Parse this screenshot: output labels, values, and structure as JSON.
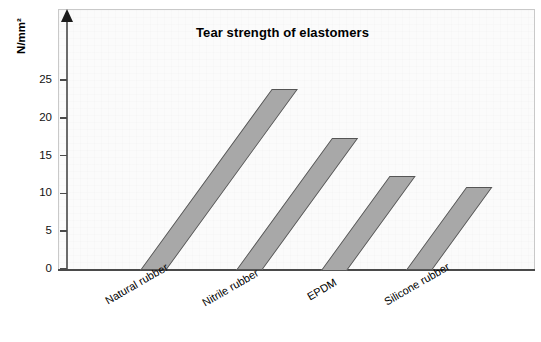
{
  "chart_data": {
    "type": "bar",
    "title": "Tear strength of elastomers",
    "xlabel": "",
    "ylabel": "N/mm²",
    "categories": [
      "Natural rubber",
      "Nitrile rubber",
      "EPDM",
      "Silicone rubber"
    ],
    "values": [
      24,
      17.5,
      12.5,
      11
    ],
    "values_back": [
      26.5,
      20,
      15,
      13.5
    ],
    "ytick_labels": [
      "0",
      "5",
      "10",
      "15",
      "20",
      "25"
    ],
    "ytick_values": [
      0,
      5,
      10,
      15,
      20,
      25
    ],
    "ylim": [
      0,
      29
    ],
    "grid": false,
    "legend": "none",
    "style": "pseudo-3d skewed bars",
    "bar_color": "#a8a8a8",
    "bar_edge_color": "#555555",
    "plot_bg": "#fbfbfb",
    "axis_color": "#4a4a4a"
  },
  "axis": {
    "y_title": "N/mm²"
  }
}
